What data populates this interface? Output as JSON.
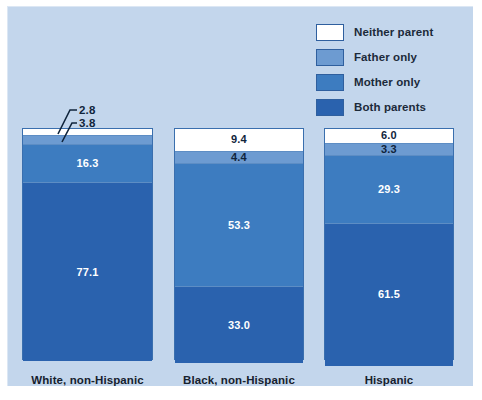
{
  "chart": {
    "type": "stacked_bar",
    "title": "",
    "background_color": "#c3d6ec",
    "page_color": "#ffffff"
  },
  "legend": {
    "position": "top-right",
    "items": [
      {
        "label": "Neither parent",
        "color": "#ffffff"
      },
      {
        "label": "Father only",
        "color": "#6d9bd1"
      },
      {
        "label": "Mother only",
        "color": "#3d7cc0"
      },
      {
        "label": "Both parents",
        "color": "#2a62ae"
      }
    ]
  },
  "chart_data": {
    "type": "bar",
    "subtype": "stacked-100",
    "title": "",
    "xlabel": "",
    "ylabel": "",
    "ylim": [
      0,
      100
    ],
    "grid": false,
    "legend_position": "top-right",
    "categories": [
      "White, non-Hispanic",
      "Black, non-Hispanic",
      "Hispanic"
    ],
    "series": [
      {
        "name": "Neither parent",
        "color": "#ffffff",
        "values": [
          2.8,
          9.4,
          6.0
        ]
      },
      {
        "name": "Father only",
        "color": "#6d9bd1",
        "values": [
          3.8,
          4.4,
          3.3
        ]
      },
      {
        "name": "Mother only",
        "color": "#3d7cc0",
        "values": [
          16.3,
          53.3,
          29.3
        ]
      },
      {
        "name": "Both parents",
        "color": "#2a62ae",
        "values": [
          77.1,
          33.0,
          61.5
        ]
      }
    ]
  },
  "bars": [
    {
      "category": "White, non-Hispanic",
      "segments": [
        {
          "series": "Neither parent",
          "value": "2.8",
          "color": "#ffffff",
          "label_mode": "callout"
        },
        {
          "series": "Father only",
          "value": "3.8",
          "color": "#6d9bd1",
          "label_mode": "callout"
        },
        {
          "series": "Mother only",
          "value": "16.3",
          "color": "#3d7cc0",
          "label_mode": "inside-white"
        },
        {
          "series": "Both parents",
          "value": "77.1",
          "color": "#2a62ae",
          "label_mode": "inside-white"
        }
      ]
    },
    {
      "category": "Black, non-Hispanic",
      "segments": [
        {
          "series": "Neither parent",
          "value": "9.4",
          "color": "#ffffff",
          "label_mode": "inside-dark"
        },
        {
          "series": "Father only",
          "value": "4.4",
          "color": "#6d9bd1",
          "label_mode": "inside-dark"
        },
        {
          "series": "Mother only",
          "value": "53.3",
          "color": "#3d7cc0",
          "label_mode": "inside-white"
        },
        {
          "series": "Both parents",
          "value": "33.0",
          "color": "#2a62ae",
          "label_mode": "inside-white"
        }
      ]
    },
    {
      "category": "Hispanic",
      "segments": [
        {
          "series": "Neither parent",
          "value": "6.0",
          "color": "#ffffff",
          "label_mode": "inside-dark"
        },
        {
          "series": "Father only",
          "value": "3.3",
          "color": "#6d9bd1",
          "label_mode": "inside-dark"
        },
        {
          "series": "Mother only",
          "value": "29.3",
          "color": "#3d7cc0",
          "label_mode": "inside-white"
        },
        {
          "series": "Both parents",
          "value": "61.5",
          "color": "#2a62ae",
          "label_mode": "inside-white"
        }
      ]
    }
  ],
  "callouts": [
    {
      "value": "2.8",
      "series": "Neither parent"
    },
    {
      "value": "3.8",
      "series": "Father only"
    }
  ]
}
